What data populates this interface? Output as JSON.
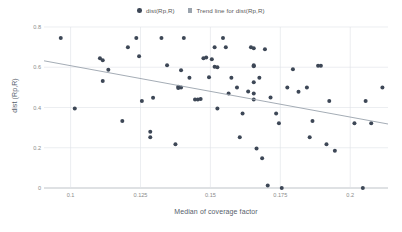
{
  "chart_data": {
    "type": "scatter",
    "title": "",
    "xlabel": "Median of coverage factor",
    "ylabel": "dist (Rp,R)",
    "xlim": [
      0.0905,
      0.2135
    ],
    "ylim": [
      0,
      0.8
    ],
    "xticks": [
      "0.1",
      "0.125",
      "0.15",
      "0.175",
      "0.2"
    ],
    "xtick_values": [
      0.1,
      0.125,
      0.15,
      0.175,
      0.2
    ],
    "yticks": [
      "0.8",
      "0.6",
      "0.4",
      "0.2",
      "0"
    ],
    "ytick_values": [
      0.8,
      0.6,
      0.4,
      0.2,
      0
    ],
    "grid": true,
    "legend_position": "top-center",
    "marker_color": "#3d4756",
    "trendline_color": "#9aa3ad",
    "grid_color": "#dfe3e8",
    "series": [
      {
        "name": "dist(Rp,R)",
        "type": "scatter",
        "points": [
          [
            0.0965,
            0.745
          ],
          [
            0.1015,
            0.395
          ],
          [
            0.1105,
            0.645
          ],
          [
            0.1115,
            0.635
          ],
          [
            0.1115,
            0.532
          ],
          [
            0.1135,
            0.588
          ],
          [
            0.1185,
            0.333
          ],
          [
            0.1205,
            0.7
          ],
          [
            0.1235,
            0.745
          ],
          [
            0.1245,
            0.655
          ],
          [
            0.1255,
            0.432
          ],
          [
            0.1285,
            0.28
          ],
          [
            0.1285,
            0.252
          ],
          [
            0.1295,
            0.448
          ],
          [
            0.1325,
            0.745
          ],
          [
            0.1345,
            0.61
          ],
          [
            0.1375,
            0.218
          ],
          [
            0.1385,
            0.503
          ],
          [
            0.1385,
            0.497
          ],
          [
            0.1395,
            0.585
          ],
          [
            0.1395,
            0.5
          ],
          [
            0.1405,
            0.745
          ],
          [
            0.1425,
            0.548
          ],
          [
            0.1445,
            0.44
          ],
          [
            0.1455,
            0.44
          ],
          [
            0.1465,
            0.442
          ],
          [
            0.1475,
            0.645
          ],
          [
            0.1485,
            0.648
          ],
          [
            0.1495,
            0.55
          ],
          [
            0.1505,
            0.64
          ],
          [
            0.1515,
            0.7
          ],
          [
            0.1515,
            0.602
          ],
          [
            0.1525,
            0.6
          ],
          [
            0.1525,
            0.395
          ],
          [
            0.1545,
            0.745
          ],
          [
            0.1555,
            0.7
          ],
          [
            0.1565,
            0.47
          ],
          [
            0.1575,
            0.548
          ],
          [
            0.1595,
            0.5
          ],
          [
            0.1605,
            0.252
          ],
          [
            0.1615,
            0.37
          ],
          [
            0.1635,
            0.48
          ],
          [
            0.1645,
            0.7
          ],
          [
            0.1655,
            0.695
          ],
          [
            0.1655,
            0.61
          ],
          [
            0.1655,
            0.605
          ],
          [
            0.1655,
            0.525
          ],
          [
            0.1655,
            0.47
          ],
          [
            0.1655,
            0.44
          ],
          [
            0.1665,
            0.196
          ],
          [
            0.1675,
            0.548
          ],
          [
            0.1685,
            0.148
          ],
          [
            0.1695,
            0.69
          ],
          [
            0.1705,
            0.012
          ],
          [
            0.1715,
            0.45
          ],
          [
            0.1735,
            0.37
          ],
          [
            0.1745,
            0.322
          ],
          [
            0.1755,
            0.0
          ],
          [
            0.1775,
            0.5
          ],
          [
            0.1795,
            0.59
          ],
          [
            0.1815,
            0.478
          ],
          [
            0.1845,
            0.5
          ],
          [
            0.1855,
            0.252
          ],
          [
            0.1865,
            0.333
          ],
          [
            0.1885,
            0.608
          ],
          [
            0.1895,
            0.608
          ],
          [
            0.1915,
            0.218
          ],
          [
            0.1925,
            0.432
          ],
          [
            0.1945,
            0.185
          ],
          [
            0.2015,
            0.322
          ],
          [
            0.2045,
            0.0
          ],
          [
            0.2055,
            0.432
          ],
          [
            0.2075,
            0.322
          ],
          [
            0.2115,
            0.5
          ]
        ]
      },
      {
        "name": "Trend line for dist(Rp,R)",
        "type": "line",
        "points": [
          [
            0.0905,
            0.632
          ],
          [
            0.2135,
            0.318
          ]
        ]
      }
    ],
    "legend": [
      {
        "label": "dist(Rp,R)",
        "marker": "circle-marker",
        "color": "#3d4756"
      },
      {
        "label": "Trend line for dist(Rp,R)",
        "marker": "square-swatch",
        "color": "#9aa3ad"
      }
    ]
  }
}
